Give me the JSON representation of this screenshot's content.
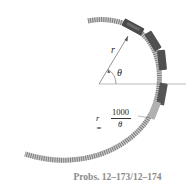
{
  "figure": {
    "type": "diagram",
    "labels": {
      "radius": "r",
      "angle": "θ",
      "equation_lhs": "r =",
      "equation_numerator": "1000",
      "equation_denominator": "θ"
    },
    "caption": "Probs. 12–173/12–174"
  },
  "colors": {
    "track": "#6b6b6b",
    "train_car": "#4a4a4a",
    "line": "#999999",
    "caption": "#8a8a8a"
  }
}
